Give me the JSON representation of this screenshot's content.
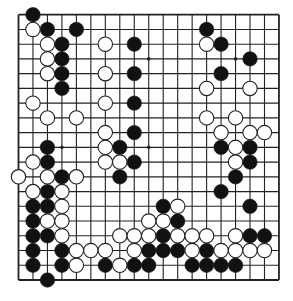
{
  "board": {
    "size": 19,
    "origin_x": 18.5,
    "origin_y": 14.7,
    "spacing_x": 14.47,
    "spacing_y": 14.74,
    "stone_radius": 7.2,
    "line_color": "#222222",
    "background": "#ffffff",
    "star_points": [
      [
        3,
        3
      ],
      [
        3,
        9
      ],
      [
        3,
        15
      ],
      [
        9,
        3
      ],
      [
        9,
        9
      ],
      [
        9,
        15
      ],
      [
        15,
        3
      ],
      [
        15,
        9
      ],
      [
        15,
        15
      ]
    ]
  },
  "colors": {
    "black_stone": "#111111",
    "white_stone": "#ffffff",
    "white_stone_edge": "#222222"
  },
  "stones": {
    "black": [
      [
        0,
        1
      ],
      [
        1,
        2
      ],
      [
        1,
        4
      ],
      [
        1,
        13
      ],
      [
        2,
        3
      ],
      [
        2,
        8
      ],
      [
        2,
        14
      ],
      [
        3,
        3
      ],
      [
        3,
        16
      ],
      [
        4,
        3
      ],
      [
        4,
        8
      ],
      [
        4,
        14
      ],
      [
        5,
        3
      ],
      [
        6,
        8
      ],
      [
        8,
        8
      ],
      [
        9,
        2
      ],
      [
        9,
        7
      ],
      [
        9,
        14
      ],
      [
        9,
        16
      ],
      [
        10,
        2
      ],
      [
        10,
        8
      ],
      [
        10,
        16
      ],
      [
        11,
        3
      ],
      [
        11,
        7
      ],
      [
        11,
        15
      ],
      [
        12,
        2
      ],
      [
        12,
        14
      ],
      [
        13,
        1
      ],
      [
        13,
        2
      ],
      [
        13,
        10
      ],
      [
        13,
        16
      ],
      [
        14,
        1
      ],
      [
        14,
        11
      ],
      [
        15,
        1
      ],
      [
        15,
        2
      ],
      [
        15,
        10
      ],
      [
        15,
        16
      ],
      [
        15,
        17
      ],
      [
        16,
        1
      ],
      [
        16,
        3
      ],
      [
        16,
        9
      ],
      [
        16,
        10
      ],
      [
        16,
        11
      ],
      [
        16,
        13
      ],
      [
        17,
        1
      ],
      [
        17,
        3
      ],
      [
        17,
        6
      ],
      [
        17,
        8
      ],
      [
        17,
        9
      ],
      [
        17,
        12
      ],
      [
        17,
        13
      ],
      [
        17,
        14
      ],
      [
        17,
        15
      ],
      [
        18,
        2
      ]
    ],
    "white": [
      [
        1,
        1
      ],
      [
        2,
        2
      ],
      [
        2,
        6
      ],
      [
        2,
        13
      ],
      [
        3,
        2
      ],
      [
        4,
        2
      ],
      [
        4,
        6
      ],
      [
        5,
        13
      ],
      [
        5,
        16
      ],
      [
        6,
        1
      ],
      [
        6,
        6
      ],
      [
        7,
        2
      ],
      [
        7,
        4
      ],
      [
        7,
        13
      ],
      [
        7,
        15
      ],
      [
        8,
        6
      ],
      [
        8,
        14
      ],
      [
        8,
        16
      ],
      [
        8,
        17
      ],
      [
        9,
        6
      ],
      [
        9,
        15
      ],
      [
        10,
        1
      ],
      [
        10,
        6
      ],
      [
        10,
        7
      ],
      [
        10,
        15
      ],
      [
        11,
        0
      ],
      [
        11,
        2
      ],
      [
        11,
        4
      ],
      [
        12,
        1
      ],
      [
        12,
        3
      ],
      [
        13,
        3
      ],
      [
        13,
        11
      ],
      [
        14,
        2
      ],
      [
        14,
        3
      ],
      [
        14,
        9
      ],
      [
        14,
        10
      ],
      [
        15,
        3
      ],
      [
        15,
        7
      ],
      [
        15,
        8
      ],
      [
        15,
        9
      ],
      [
        15,
        11
      ],
      [
        15,
        12
      ],
      [
        15,
        13
      ],
      [
        15,
        15
      ],
      [
        16,
        4
      ],
      [
        16,
        5
      ],
      [
        16,
        6
      ],
      [
        16,
        8
      ],
      [
        16,
        12
      ],
      [
        16,
        14
      ],
      [
        16,
        15
      ],
      [
        16,
        16
      ],
      [
        16,
        17
      ],
      [
        17,
        4
      ],
      [
        17,
        7
      ]
    ]
  }
}
